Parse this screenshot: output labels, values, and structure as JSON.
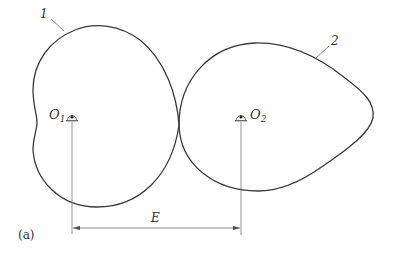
{
  "figure": {
    "panel_label": "(a)",
    "dimension_label": "E",
    "parts": [
      {
        "id": "1",
        "label": "1",
        "description": "driving noncircular gear pitch curve"
      },
      {
        "id": "2",
        "label": "2",
        "description": "driven noncircular gear pitch curve"
      }
    ],
    "pivots": [
      {
        "name": "O",
        "sub": "1"
      },
      {
        "name": "O",
        "sub": "2"
      }
    ],
    "colors": {
      "curve": "#3a3a3a",
      "thin_line": "#555555",
      "text": "#333333"
    }
  }
}
